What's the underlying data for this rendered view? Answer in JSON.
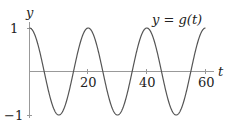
{
  "chart_data": {
    "type": "line",
    "title": "",
    "series": [
      {
        "name": "y = g(t)",
        "function": "cos(2*pi*t/20)",
        "x": [
          0,
          5,
          10,
          15,
          20,
          25,
          30,
          35,
          40,
          45,
          50,
          55,
          60
        ],
        "values": [
          1,
          0,
          -1,
          0,
          1,
          0,
          -1,
          0,
          1,
          0,
          -1,
          0,
          1
        ]
      }
    ],
    "xlabel": "t",
    "ylabel": "y",
    "xticks": [
      "20",
      "40",
      "60"
    ],
    "yticks": [
      "1",
      "-1"
    ],
    "xlim": [
      0,
      63
    ],
    "ylim": [
      -1,
      1
    ],
    "grid": false,
    "annotation": "y = g(t)"
  },
  "labels": {
    "y_axis": "y",
    "t_axis": "t",
    "tick_1": "1",
    "tick_neg1": "−1",
    "tick_20": "20",
    "tick_40": "40",
    "tick_60": "60",
    "curve": "y = g(t)"
  },
  "colors": {
    "curve": "#555555",
    "axis": "#888888"
  }
}
